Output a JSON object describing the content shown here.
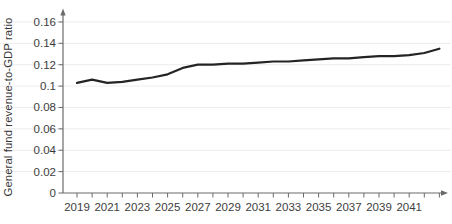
{
  "chart_data": {
    "type": "line",
    "title": "",
    "xlabel": "",
    "ylabel": "General fund revenue-to-GDP ratio",
    "series_name": "General fund revenue-to-GDP ratio",
    "x": [
      2019,
      2020,
      2021,
      2022,
      2023,
      2024,
      2025,
      2026,
      2027,
      2028,
      2029,
      2030,
      2031,
      2032,
      2033,
      2034,
      2035,
      2036,
      2037,
      2038,
      2039,
      2040,
      2041,
      2042,
      2043
    ],
    "values": [
      0.103,
      0.106,
      0.103,
      0.104,
      0.106,
      0.108,
      0.111,
      0.117,
      0.12,
      0.12,
      0.121,
      0.121,
      0.122,
      0.123,
      0.123,
      0.124,
      0.125,
      0.126,
      0.126,
      0.127,
      0.128,
      0.128,
      0.129,
      0.131,
      0.135
    ],
    "xlim": [
      2019,
      2043
    ],
    "ylim": [
      0,
      0.17
    ],
    "y_ticks": [
      0,
      0.02,
      0.04,
      0.06,
      0.08,
      0.1,
      0.12,
      0.14,
      0.16
    ],
    "y_tick_labels": [
      "0",
      "0.02",
      "0.04",
      "0.06",
      "0.08",
      "0.1",
      "0.12",
      "0.14",
      "0.16"
    ],
    "x_tick_labels": [
      "2019",
      "2021",
      "2023",
      "2025",
      "2027",
      "2029",
      "2031",
      "2033",
      "2035",
      "2037",
      "2039",
      "2041"
    ],
    "grid": "horizontal-light-full-width",
    "legend": "none",
    "axes_arrows": true,
    "colors": {
      "line": "#242424",
      "axis": "#6a6a6a",
      "grid": "#ececec",
      "text": "#3d3d3d"
    }
  }
}
